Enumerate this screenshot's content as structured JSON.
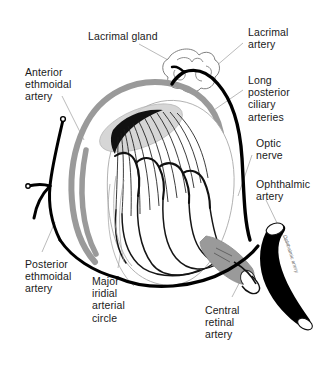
{
  "figure": {
    "background_color": "#ffffff",
    "ink_color": "#000000",
    "accent_gray": "#9a9a9a",
    "leader_color": "#a8a8a8",
    "width": 328,
    "height": 369
  },
  "labels": {
    "lacrimal_gland": "Lacrimal gland",
    "lacrimal_artery": "Lacrimal\nartery",
    "anterior_ethmoidal_artery": "Anterior\nethmoidal\nartery",
    "long_posterior_ciliary_arteries": "Long\nposterior\nciliary\narteries",
    "optic_nerve": "Optic\nnerve",
    "ophthalmic_artery": "Ophthalmic\nartery",
    "posterior_ethmoidal_artery": "Posterior\nethmoidal\nartery",
    "major_iridial_arterial_circle": "Major\niridial\narterial\ncircle",
    "central_retinal_artery": "Central\nretinal\nartery",
    "vessel_inline_caption": "Ophthalmic artery"
  },
  "structures": [
    {
      "name": "lacrimal-gland",
      "kind": "lobulated-outline",
      "fill": "#ffffff",
      "stroke": "#6f6f6f"
    },
    {
      "name": "globe",
      "kind": "eyeball-outline",
      "fill": "#ffffff",
      "stroke": "#111111"
    },
    {
      "name": "long-posterior-ciliary-arc",
      "kind": "thick-arc",
      "color": "#9a9a9a"
    },
    {
      "name": "iris-ciliary-body",
      "kind": "radiating-vessel-fan",
      "color": "#111111"
    },
    {
      "name": "cornea-wedge",
      "kind": "gray-ellipse",
      "color": "#bdbdbd"
    },
    {
      "name": "optic-nerve-stump",
      "kind": "gray-cylinder",
      "color": "#8f8f8f"
    },
    {
      "name": "ophthalmic-artery-trunk",
      "kind": "thick-black-cylinder",
      "color": "#000000"
    },
    {
      "name": "central-retinal-artery",
      "kind": "small-cylinder",
      "color": "#ffffff"
    },
    {
      "name": "anterior-ethmoidal-branch",
      "kind": "black-vessel",
      "color": "#000000"
    },
    {
      "name": "posterior-ethmoidal-branch",
      "kind": "black-vessel",
      "color": "#000000"
    }
  ]
}
